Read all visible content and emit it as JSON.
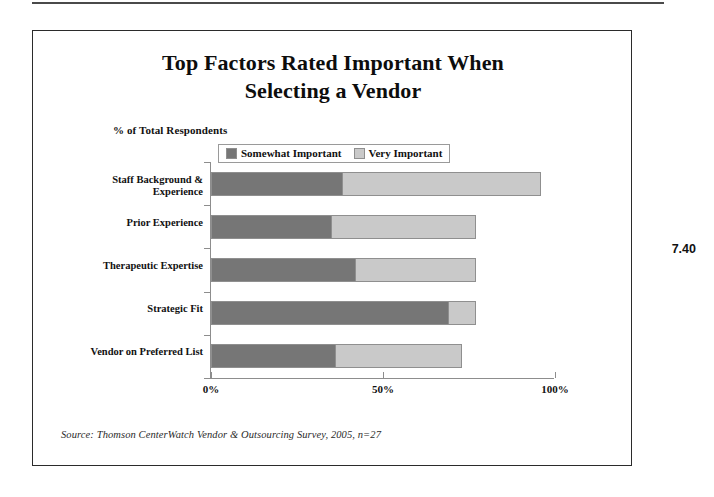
{
  "page": {
    "number_label": "7.40"
  },
  "figure": {
    "title": "Top Factors Rated Important When Selecting a Vendor",
    "title_line1": "Top Factors Rated Important When",
    "title_line2": "Selecting a Vendor",
    "axis_note": "% of Total Respondents",
    "source": "Source: Thomson CenterWatch Vendor & Outsourcing Survey, 2005, n=27"
  },
  "legend": {
    "entries": [
      {
        "label": "Somewhat Important",
        "color": "#767676"
      },
      {
        "label": "Very Important",
        "color": "#c9c9c9"
      }
    ]
  },
  "colors": {
    "somewhat_important": "#767676",
    "very_important": "#c9c9c9",
    "axis": "#8d8d8d",
    "frame": "#2b2b2b",
    "text": "#111111"
  },
  "chart_data": {
    "type": "bar",
    "orientation": "horizontal",
    "stacked": true,
    "title": "Top Factors Rated Important When Selecting a Vendor",
    "subtitle": "% of Total Respondents",
    "xlabel": "",
    "ylabel": "",
    "xlim": [
      0,
      100
    ],
    "xticks": [
      0,
      50,
      100
    ],
    "xtick_labels": [
      "0%",
      "50%",
      "100%"
    ],
    "grid": false,
    "legend_position": "top-center",
    "categories": [
      "Staff Background & Experience",
      "Prior Experience",
      "Therapeutic Expertise",
      "Strategic Fit",
      "Vendor on Preferred List"
    ],
    "series": [
      {
        "name": "Somewhat Important",
        "color": "#767676",
        "values": [
          38,
          35,
          42,
          69,
          36
        ]
      },
      {
        "name": "Very Important",
        "color": "#c9c9c9",
        "values": [
          58,
          42,
          35,
          8,
          37
        ]
      }
    ],
    "totals": [
      96,
      77,
      77,
      77,
      73
    ],
    "annotations": [
      "Source: Thomson CenterWatch Vendor & Outsourcing Survey, 2005, n=27"
    ]
  }
}
